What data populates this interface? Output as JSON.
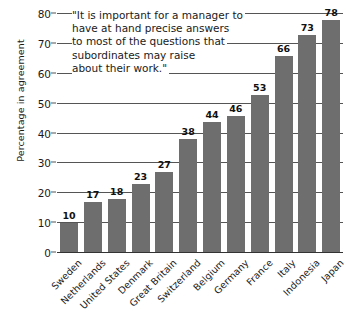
{
  "chart_data": {
    "type": "bar",
    "title": "",
    "subtitle": "",
    "xlabel": "",
    "ylabel": "Percentage in agreement",
    "ylim": [
      0,
      80
    ],
    "ytick_step": 10,
    "yticks": [
      "0",
      "10",
      "20",
      "30",
      "40",
      "50",
      "60",
      "70",
      "80"
    ],
    "grid": true,
    "legend": "none",
    "bar_color": "#6e6e6e",
    "categories": [
      "Sweden",
      "Netherlands",
      "United States",
      "Denmark",
      "Great Britain",
      "Switzerland",
      "Belgium",
      "Germany",
      "France",
      "Italy",
      "Indonesia",
      "Japan"
    ],
    "values": [
      10,
      17,
      18,
      23,
      27,
      38,
      44,
      46,
      53,
      66,
      73,
      78
    ],
    "value_labels": [
      "10",
      "17",
      "18",
      "23",
      "27",
      "38",
      "44",
      "46",
      "53",
      "66",
      "73",
      "78"
    ],
    "annotation": {
      "lines": [
        "\"It is important for a manager to",
        "have at hand precise answers",
        "to most of the questions that",
        "subordinates may raise",
        "about their work.\""
      ]
    }
  }
}
